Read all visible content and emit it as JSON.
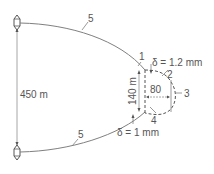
{
  "diagram": {
    "dimensions": {
      "span": "450 m",
      "height": "140 m",
      "width": "80"
    },
    "deflections": {
      "top": "δ = 1.2 mm",
      "bottom": "δ = 1 mm"
    },
    "callouts": {
      "c1": "1",
      "c2": "2",
      "c3": "3",
      "c4": "4",
      "c5_top": "5",
      "c5_bottom": "5"
    },
    "colors": {
      "line": "#808080",
      "text": "#555555"
    }
  }
}
